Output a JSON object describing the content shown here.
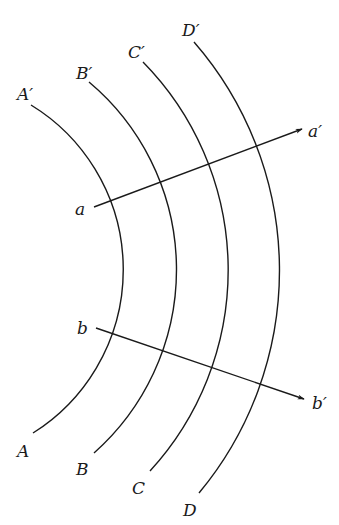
{
  "diagram": {
    "center": {
      "x": -69,
      "y": 270
    },
    "stroke_color": "#1a1a1a",
    "background": "#ffffff",
    "wavefronts": [
      {
        "id": "A",
        "start_label": "A",
        "end_label": "A′",
        "radius": 193,
        "bottom": {
          "x": 33,
          "y": 433
        },
        "top": {
          "x": 31,
          "y": 105
        },
        "start_label_pos": {
          "x": 17,
          "y": 457
        },
        "end_label_pos": {
          "x": 17,
          "y": 100
        }
      },
      {
        "id": "B",
        "start_label": "B",
        "end_label": "B′",
        "radius": 245,
        "bottom": {
          "x": 94,
          "y": 453
        },
        "top": {
          "x": 89,
          "y": 82
        },
        "start_label_pos": {
          "x": 76,
          "y": 475
        },
        "end_label_pos": {
          "x": 76,
          "y": 79
        }
      },
      {
        "id": "C",
        "start_label": "C",
        "end_label": "C′",
        "radius": 297,
        "bottom": {
          "x": 150,
          "y": 471
        },
        "top": {
          "x": 143,
          "y": 62
        },
        "start_label_pos": {
          "x": 132,
          "y": 494
        },
        "end_label_pos": {
          "x": 128,
          "y": 58
        }
      },
      {
        "id": "D",
        "start_label": "D",
        "end_label": "D′",
        "radius": 348,
        "bottom": {
          "x": 199,
          "y": 493
        },
        "top": {
          "x": 194,
          "y": 42
        },
        "start_label_pos": {
          "x": 183,
          "y": 516
        },
        "end_label_pos": {
          "x": 182,
          "y": 36
        }
      }
    ],
    "rays": [
      {
        "id": "a",
        "start_label": "a",
        "end_label": "a′",
        "from": {
          "x": 94,
          "y": 207
        },
        "to": {
          "x": 302,
          "y": 129
        },
        "start_label_pos": {
          "x": 75,
          "y": 215
        },
        "end_label_pos": {
          "x": 308,
          "y": 137
        }
      },
      {
        "id": "b",
        "start_label": "b",
        "end_label": "b′",
        "from": {
          "x": 96,
          "y": 328
        },
        "to": {
          "x": 304,
          "y": 399
        },
        "start_label_pos": {
          "x": 77,
          "y": 334
        },
        "end_label_pos": {
          "x": 312,
          "y": 409
        }
      }
    ]
  },
  "labels": {
    "A": "A",
    "A_prime": "A′",
    "B": "B",
    "B_prime": "B′",
    "C": "C",
    "C_prime": "C′",
    "D": "D",
    "D_prime": "D′",
    "a": "a",
    "a_prime": "a′",
    "b": "b",
    "b_prime": "b′"
  }
}
